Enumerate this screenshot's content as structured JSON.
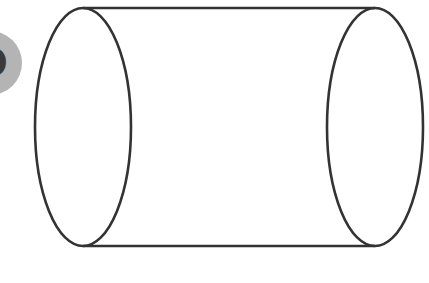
{
  "badge": {
    "label": "D",
    "color": "#b4b4b4",
    "text_color": "#3a3a3a"
  },
  "diagram": {
    "shape": "cylinder",
    "orientation": "horizontal",
    "stroke_color": "#333333",
    "fill_color": "#ffffff",
    "left_end": {
      "cx": 83,
      "cy": 127,
      "rx": 48,
      "ry": 119
    },
    "right_end": {
      "cx": 375,
      "cy": 127,
      "rx": 48,
      "ry": 119
    }
  }
}
